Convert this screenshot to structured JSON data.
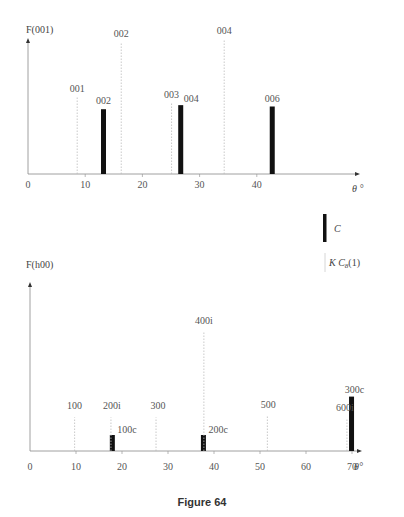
{
  "caption": "Figure 64",
  "page_mark": "",
  "chart_data": [
    {
      "type": "bar",
      "title": "",
      "ylabel": "F(001)",
      "xlabel": "θ °",
      "xlim": [
        0,
        52
      ],
      "xticks": [
        0,
        10,
        20,
        30,
        40
      ],
      "grid": false,
      "series": [
        {
          "name": "C",
          "style": "thick-bar",
          "points": [
            {
              "label": "002",
              "x": 13.2,
              "y": 0.48
            },
            {
              "label": "004",
              "x": 26.7,
              "y": 0.51
            },
            {
              "label": "006",
              "x": 42.7,
              "y": 0.5
            }
          ]
        },
        {
          "name": "K C8(1)",
          "style": "dotted-line",
          "points": [
            {
              "label": "001",
              "x": 8.6,
              "y": 0.57
            },
            {
              "label": "002",
              "x": 16.3,
              "y": 0.97
            },
            {
              "label": "003",
              "x": 25.1,
              "y": 0.53
            },
            {
              "label": "004",
              "x": 34.3,
              "y": 0.99
            }
          ]
        }
      ]
    },
    {
      "type": "bar",
      "title": "",
      "ylabel": "F(h00)",
      "xlabel": "θ°",
      "xlim": [
        0,
        75
      ],
      "xticks": [
        0,
        10,
        20,
        30,
        40,
        50,
        60,
        70
      ],
      "grid": false,
      "series": [
        {
          "name": "C",
          "style": "thick-bar",
          "points": [
            {
              "label": "100c",
              "x": 17.9,
              "y": 0.1
            },
            {
              "label": "200c",
              "x": 37.7,
              "y": 0.1
            },
            {
              "label": "300c",
              "x": 69.9,
              "y": 0.34
            }
          ]
        },
        {
          "name": "K C8(1)",
          "style": "dotted-line",
          "points": [
            {
              "label": "100",
              "x": 9.7,
              "y": 0.21
            },
            {
              "label": "200i",
              "x": 17.6,
              "y": 0.21
            },
            {
              "label": "300",
              "x": 27.4,
              "y": 0.21
            },
            {
              "label": "400i",
              "x": 37.8,
              "y": 0.75
            },
            {
              "label": "500",
              "x": 51.6,
              "y": 0.22
            },
            {
              "label": "600i",
              "x": 68.9,
              "y": 0.2
            }
          ]
        }
      ]
    }
  ],
  "legend": {
    "items": [
      {
        "symbol": "thick-bar",
        "label": "C"
      },
      {
        "symbol": "thin-line",
        "label_main": "K C",
        "label_sub": "8",
        "label_tail": "(1)"
      }
    ]
  },
  "view": {
    "top": {
      "x0": 28,
      "px_per_deg": 5.72,
      "baseline": 174,
      "unit_h": 135,
      "axis_top": 38,
      "axis_end": 360
    },
    "bottom": {
      "x0": 30,
      "px_per_deg": 4.6,
      "baseline": 451,
      "unit_h": 160,
      "axis_top": 282,
      "axis_end": 362
    }
  }
}
